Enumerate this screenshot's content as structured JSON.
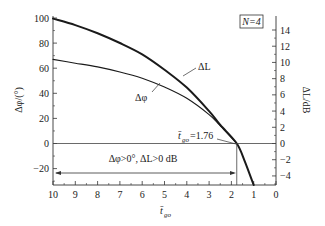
{
  "chart_data": {
    "type": "line",
    "title": "",
    "legend_box": "N=4",
    "xlabel": "t̄go",
    "ylabel_left": "Δφ/(°)",
    "ylabel_right": "ΔL/dB",
    "x_range": [
      10,
      0
    ],
    "x_reversed": true,
    "ylim_left": [
      -33.6,
      103
    ],
    "ylim_right": [
      -5.2,
      15.5
    ],
    "x_ticks": [
      10,
      9,
      8,
      7,
      6,
      5,
      4,
      3,
      2,
      1,
      0
    ],
    "y_ticks_left": [
      100,
      80,
      60,
      40,
      20,
      0,
      -20
    ],
    "y_ticks_right": [
      14,
      12,
      10,
      8,
      6,
      4,
      2,
      0,
      -2,
      -4
    ],
    "grid": false,
    "series": [
      {
        "name": "ΔL",
        "axis": "right",
        "line_width": "thick",
        "x": [
          10,
          9,
          8,
          7,
          6,
          5,
          4,
          3,
          2.5,
          1.76,
          1.4,
          1.0
        ],
        "y": [
          15.4,
          14.6,
          13.6,
          12.4,
          11.0,
          9.1,
          6.9,
          4.0,
          2.3,
          0,
          -2.2,
          -5.2
        ]
      },
      {
        "name": "Δφ",
        "axis": "left",
        "line_width": "thin",
        "x": [
          10,
          9,
          8,
          7,
          6,
          5,
          4,
          3,
          2.5,
          1.76
        ],
        "y": [
          67,
          64,
          61,
          57,
          52,
          45,
          36,
          23,
          14,
          0
        ]
      }
    ],
    "annotations": [
      {
        "text": "ΔL",
        "target_series": "ΔL"
      },
      {
        "text": "Δφ",
        "target_series": "Δφ"
      },
      {
        "text": "t̄go=1.76",
        "x": 1.76,
        "y": 0
      },
      {
        "text": "Δφ>0°, ΔL>0 dB",
        "type": "double-arrow",
        "x_from": 10,
        "x_to": 1.76,
        "y_left": -23
      }
    ],
    "reference_lines": [
      {
        "type": "horizontal",
        "axis": "left",
        "value": 0
      },
      {
        "type": "vertical",
        "value": 1.76
      }
    ]
  },
  "labels": {
    "legend_box": "N=4",
    "ylabel_left_main": "Δφ/(°)",
    "ylabel_right_main": "ΔL/dB",
    "xlabel_main": "t̄",
    "xlabel_sub": "go",
    "series_label_dl": "ΔL",
    "series_label_dphi": "Δφ",
    "tgo_label_main": "t̄",
    "tgo_label_sub": "go",
    "tgo_label_value": "=1.76",
    "region_label": "Δφ>0°, ΔL>0 dB"
  }
}
